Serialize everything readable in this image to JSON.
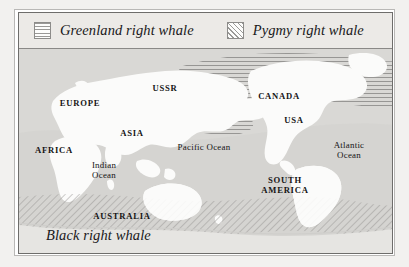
{
  "figure": {
    "legend": {
      "items": [
        {
          "label": "Greenland right whale",
          "swatch": "horizontal-line-hatch-swatch"
        },
        {
          "label": "Pygmy right whale",
          "swatch": "diagonal-line-hatch-swatch"
        }
      ]
    },
    "caption": "Black right whale",
    "map": {
      "continent_labels": [
        {
          "text": "USSR",
          "x": 146,
          "y": 35
        },
        {
          "text": "EUROPE",
          "x": 61,
          "y": 50
        },
        {
          "text": "ASIA",
          "x": 113,
          "y": 80
        },
        {
          "text": "AFRICA",
          "x": 35,
          "y": 97
        },
        {
          "text": "CANADA",
          "x": 260,
          "y": 43
        },
        {
          "text": "USA",
          "x": 275,
          "y": 67
        },
        {
          "text": "AUSTRALIA",
          "x": 103,
          "y": 163
        }
      ],
      "two_line_labels": [
        {
          "line1": "SOUTH",
          "line2": "AMERICA",
          "x": 266,
          "y": 127,
          "style": "caps"
        },
        {
          "line1": "Atlantic",
          "line2": "Ocean",
          "x": 330,
          "y": 92,
          "style": "ocean"
        },
        {
          "line1": "Indian",
          "line2": "Ocean",
          "x": 85,
          "y": 112,
          "style": "ocean"
        }
      ],
      "ocean_labels": [
        {
          "text": "Pacific Ocean",
          "x": 185,
          "y": 94
        }
      ]
    },
    "colors": {
      "page_background": "#f2f1ef",
      "map_ocean": "#d9d8d5",
      "map_land": "#fbfbfa",
      "hatch_line": "#9a9997",
      "frame_inner": "#6e6d6b",
      "frame_outer": "#b9b8b6",
      "legend_background": "#eceae7",
      "text": "#141314"
    }
  }
}
